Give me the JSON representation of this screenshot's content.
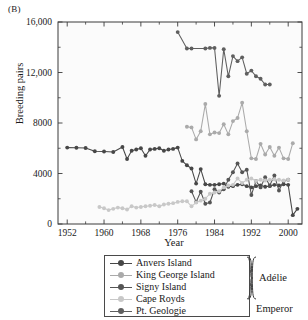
{
  "panel": {
    "label": "(B)"
  },
  "chart_data": {
    "type": "line",
    "title": "",
    "xlabel": "Year",
    "ylabel": "Breeding pairs",
    "xlim": [
      1950,
      2003
    ],
    "ylim": [
      0,
      16000
    ],
    "xticks": [
      1952,
      1960,
      1968,
      1976,
      1984,
      1992,
      2000
    ],
    "xticklabels": [
      "1952",
      "1960",
      "1968",
      "1976",
      "1984",
      "1992",
      "2000"
    ],
    "xminor_step": 4,
    "yticks": [
      0,
      4000,
      8000,
      12000,
      16000
    ],
    "yticklabels": [
      "0",
      "4000",
      "8000",
      "12,000",
      "16,000"
    ],
    "yminor_step": 2000,
    "grid": false,
    "legend_position": "below",
    "series": [
      {
        "name": "Anvers Island",
        "color": "#474747",
        "group": "Adélie",
        "x": [
          1952,
          1954,
          1956,
          1958,
          1960,
          1962,
          1964,
          1965,
          1966,
          1967,
          1968,
          1969,
          1970,
          1971,
          1972,
          1973,
          1974,
          1975,
          1976,
          1977,
          1978,
          1979,
          1980,
          1981,
          1982,
          1983,
          1984,
          1985,
          1986,
          1987,
          1988,
          1989,
          1990,
          1991,
          1992,
          1993,
          1994,
          1995,
          1996,
          1997,
          1998,
          1999,
          2000,
          2001,
          2002
        ],
        "values": [
          6050,
          6040,
          6020,
          5760,
          5740,
          5700,
          6100,
          5150,
          5800,
          5900,
          6000,
          5400,
          5900,
          5950,
          6000,
          5800,
          5900,
          5950,
          6050,
          5000,
          4650,
          4400,
          3200,
          4350,
          3150,
          3100,
          3100,
          3150,
          3200,
          2950,
          3000,
          3100,
          3150,
          3000,
          2900,
          3000,
          3050,
          2950,
          3000,
          3100,
          3050,
          3150,
          3100,
          700,
          1200
        ]
      },
      {
        "name": "King George Island",
        "color": "#aaaaaa",
        "group": "Adélie",
        "x": [
          1978,
          1979,
          1980,
          1981,
          1982,
          1983,
          1984,
          1985,
          1986,
          1987,
          1988,
          1989,
          1990,
          1991,
          1992,
          1993,
          1994,
          1995,
          1996,
          1997,
          1998,
          1999,
          2000,
          2001
        ],
        "values": [
          7700,
          7650,
          6700,
          7350,
          9500,
          7100,
          7250,
          7200,
          7900,
          7100,
          8150,
          8400,
          9600,
          7350,
          5200,
          5150,
          6350,
          5500,
          6100,
          5400,
          6050,
          5200,
          5150,
          6400
        ]
      },
      {
        "name": "Signy Island",
        "color": "#555555",
        "group": "Adélie",
        "x": [
          1979,
          1980,
          1981,
          1982,
          1983,
          1984,
          1985,
          1986,
          1987,
          1988,
          1989,
          1990,
          1991,
          1992,
          1993,
          1994,
          1995,
          1996,
          1997,
          1998,
          1999,
          2000
        ],
        "values": [
          2600,
          1750,
          2550,
          1600,
          1700,
          2750,
          2500,
          2750,
          3500,
          4100,
          4800,
          4100,
          4300,
          2300,
          3400,
          2900,
          3700,
          3050,
          3850,
          2650,
          3400,
          3500
        ]
      },
      {
        "name": "Cape Royds",
        "color": "#c8c8c8",
        "group": "Adélie",
        "x": [
          1959,
          1960,
          1961,
          1962,
          1963,
          1964,
          1965,
          1966,
          1967,
          1968,
          1969,
          1970,
          1971,
          1972,
          1973,
          1974,
          1975,
          1976,
          1977,
          1978,
          1979,
          1980,
          1981,
          1982,
          1983,
          1984,
          1985,
          1986,
          1987,
          1988,
          1989,
          1990,
          1991,
          1992,
          1993,
          1994,
          1995,
          1996,
          1997,
          1998,
          1999,
          2000
        ],
        "values": [
          1350,
          1250,
          1100,
          1200,
          1300,
          1250,
          1150,
          1400,
          1300,
          1350,
          1400,
          1450,
          1500,
          1400,
          1550,
          1600,
          1650,
          1750,
          1800,
          1800,
          1400,
          1700,
          1850,
          2000,
          2400,
          2500,
          2600,
          2900,
          3050,
          3100,
          3600,
          3250,
          3500,
          3600,
          3400,
          3500,
          3450,
          3500,
          3550,
          3500,
          3450,
          3500
        ]
      },
      {
        "name": "Pt. Geologie",
        "color": "#5f5f5f",
        "group": "Emperor",
        "x": [
          1976,
          1978,
          1979,
          1982,
          1983,
          1984,
          1985,
          1986,
          1987,
          1988,
          1989,
          1990,
          1991,
          1992,
          1993,
          1994,
          1995,
          1996
        ],
        "values": [
          15200,
          13900,
          13900,
          13900,
          13950,
          13950,
          10150,
          13850,
          11700,
          13300,
          12900,
          13200,
          11900,
          12150,
          11700,
          11500,
          11050,
          11050
        ]
      }
    ]
  },
  "legend": {
    "items": [
      {
        "label": "Anvers Island",
        "color": "#474747"
      },
      {
        "label": "King George Island",
        "color": "#aaaaaa"
      },
      {
        "label": "Signy Island",
        "color": "#555555"
      },
      {
        "label": "Cape Royds",
        "color": "#c8c8c8"
      },
      {
        "label": "Pt. Geologie",
        "color": "#5f5f5f"
      }
    ],
    "group_adelie": "Adélie",
    "group_emperor": "Emperor"
  }
}
